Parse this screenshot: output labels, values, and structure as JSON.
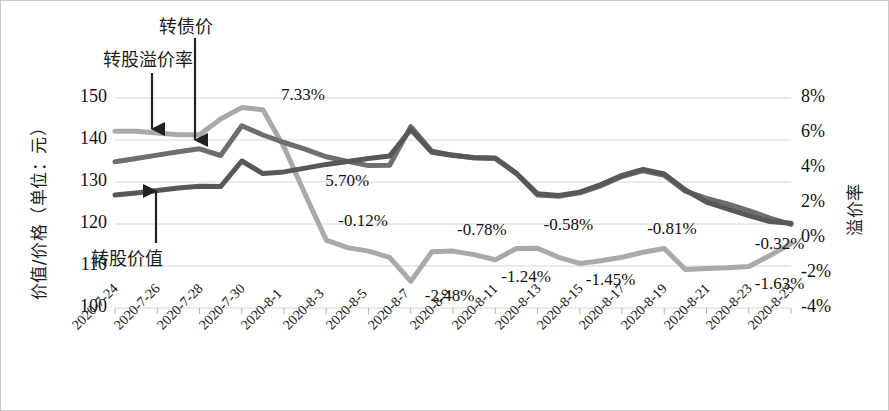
{
  "chart_data": {
    "type": "line",
    "title": "",
    "xlabel": "",
    "ylabel": "价值/价格（单位：元）",
    "ylabel_right": "溢价率",
    "ylim": [
      100,
      150
    ],
    "ylim_right": [
      -4,
      8
    ],
    "yticks": [
      "150",
      "140",
      "130",
      "120",
      "110",
      "100"
    ],
    "yticks_right": [
      "8%",
      "6%",
      "4%",
      "2%",
      "0%",
      "-2%",
      "-4%"
    ],
    "grid": true,
    "legend_position": "annotations",
    "x": [
      "2020-7-24",
      "2020-7-25",
      "2020-7-26",
      "2020-7-27",
      "2020-7-28",
      "2020-7-29",
      "2020-7-30",
      "2020-7-31",
      "2020-8-1",
      "2020-8-2",
      "2020-8-3",
      "2020-8-4",
      "2020-8-5",
      "2020-8-6",
      "2020-8-7",
      "2020-8-8",
      "2020-8-9",
      "2020-8-10",
      "2020-8-11",
      "2020-8-12",
      "2020-8-13",
      "2020-8-14",
      "2020-8-15",
      "2020-8-16",
      "2020-8-17",
      "2020-8-18",
      "2020-8-19",
      "2020-8-20",
      "2020-8-21",
      "2020-8-22",
      "2020-8-23",
      "2020-8-24",
      "2020-8-25"
    ],
    "xticks": [
      "2020-7-24",
      "2020-7-26",
      "2020-7-28",
      "2020-7-30",
      "2020-8-1",
      "2020-8-3",
      "2020-8-5",
      "2020-8-7",
      "2020-8-9",
      "2020-8-11",
      "2020-8-13",
      "2020-8-15",
      "2020-8-17",
      "2020-8-19",
      "2020-8-21",
      "2020-8-23",
      "2020-8-25"
    ],
    "series": [
      {
        "name": "转股溢价率",
        "axis": "right",
        "color": "#a9a9a9",
        "unit": "%",
        "values": [
          6.1,
          6.1,
          6.0,
          5.9,
          5.9,
          6.8,
          7.45,
          7.33,
          5.2,
          2.5,
          -0.12,
          -0.55,
          -0.75,
          -1.1,
          -2.48,
          -0.78,
          -0.75,
          -0.95,
          -1.24,
          -0.6,
          -0.58,
          -1.1,
          -1.45,
          -1.3,
          -1.1,
          -0.81,
          -0.6,
          -1.8,
          -1.75,
          -1.7,
          -1.63,
          -1.0,
          -0.32
        ]
      },
      {
        "name": "转债价",
        "axis": "left",
        "color": "#6e6e6e",
        "unit": "元",
        "values": [
          134.8,
          135.6,
          136.4,
          137.2,
          137.9,
          136.3,
          143.4,
          141.2,
          139.4,
          137.8,
          136.0,
          134.9,
          133.9,
          134.0,
          143.2,
          137.3,
          136.4,
          135.7,
          135.6,
          132.0,
          126.9,
          126.6,
          127.4,
          129.1,
          131.3,
          132.7,
          131.6,
          127.8,
          126.1,
          124.8,
          123.2,
          121.4,
          119.9
        ]
      },
      {
        "name": "转股价值",
        "axis": "left",
        "color": "#585858",
        "unit": "元",
        "values": [
          126.9,
          127.4,
          128.0,
          128.6,
          129.0,
          128.9,
          135.0,
          132.0,
          132.4,
          133.3,
          134.2,
          134.9,
          135.6,
          136.2,
          142.5,
          137.1,
          136.3,
          135.8,
          135.7,
          132.1,
          127.2,
          126.8,
          127.6,
          129.4,
          131.6,
          133.0,
          131.9,
          128.1,
          125.2,
          123.6,
          122.0,
          120.6,
          120.2
        ]
      }
    ],
    "data_labels": [
      {
        "text": "7.33%",
        "x": 7,
        "anchor_series": 0,
        "dx": 18,
        "dy": -14
      },
      {
        "text": "5.70%",
        "x": 9,
        "anchor_series": 0,
        "dx": 20,
        "dy": -12
      },
      {
        "text": "-0.12%",
        "x": 10,
        "anchor_series": 0,
        "dx": 12,
        "dy": -18
      },
      {
        "text": "-2.48%",
        "x": 14,
        "anchor_series": 0,
        "dx": 14,
        "dy": 16
      },
      {
        "text": "-0.78%",
        "x": 16,
        "anchor_series": 0,
        "dx": 4,
        "dy": -20
      },
      {
        "text": "-1.24%",
        "x": 18,
        "anchor_series": 0,
        "dx": 6,
        "dy": 18
      },
      {
        "text": "-0.58%",
        "x": 20,
        "anchor_series": 0,
        "dx": 6,
        "dy": -22
      },
      {
        "text": "-1.45%",
        "x": 22,
        "anchor_series": 0,
        "dx": 6,
        "dy": 18
      },
      {
        "text": "-0.81%",
        "x": 25,
        "anchor_series": 0,
        "dx": 4,
        "dy": -22
      },
      {
        "text": "-1.45%",
        "x": 22,
        "anchor_series": 0,
        "dx": 6,
        "dy": 18
      },
      {
        "text": "-0.32%",
        "x": 30,
        "anchor_series": 0,
        "dx": 6,
        "dy": -22
      },
      {
        "text": "-1.63%",
        "x": 30,
        "anchor_series": 0,
        "dx": 6,
        "dy": 18
      }
    ],
    "annotations": [
      {
        "label": "转债价",
        "target_series": 1
      },
      {
        "label": "转股溢价率",
        "target_series": 0
      },
      {
        "label": "转股价值",
        "target_series": 2
      }
    ]
  },
  "labels": {
    "y_left_title": "价值/价格（单位：元）",
    "y_right_title": "溢价率",
    "annot_bond_price": "转债价",
    "annot_premium_rate": "转股溢价率",
    "annot_conversion_value": "转股价值",
    "dl_733": "7.33%",
    "dl_570": "5.70%",
    "dl_m012": "-0.12%",
    "dl_m248": "-2.48%",
    "dl_m078": "-0.78%",
    "dl_m124": "-1.24%",
    "dl_m058": "-0.58%",
    "dl_m145": "-1.45%",
    "dl_m081": "-0.81%",
    "dl_m163": "-1.63%",
    "dl_m032": "-0.32%"
  },
  "y_left_ticks": [
    "150",
    "140",
    "130",
    "120",
    "110",
    "100"
  ],
  "y_right_ticks": [
    "8%",
    "6%",
    "4%",
    "2%",
    "0%",
    "-2%",
    "-4%"
  ]
}
